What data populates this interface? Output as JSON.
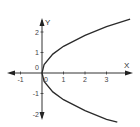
{
  "chart_data": {
    "type": "line",
    "title": "",
    "equation_hint": "sideways parabola x = y^2 / k (opening right, vertex at origin)",
    "xlabel": "X",
    "ylabel": "Y",
    "xlim": [
      -1.5,
      4.2
    ],
    "ylim": [
      -2.2,
      2.6
    ],
    "grid": false,
    "legend": null,
    "x_ticks": [
      "-1",
      "0",
      "1",
      "2",
      "3"
    ],
    "y_ticks": [
      "2",
      "1",
      "0",
      "-1",
      "-2"
    ],
    "series": [
      {
        "name": "curve",
        "points": [
          [
            4.1,
            2.63
          ],
          [
            3.0,
            2.26
          ],
          [
            2.0,
            1.84
          ],
          [
            1.0,
            1.3
          ],
          [
            0.5,
            0.92
          ],
          [
            0.1,
            0.41
          ],
          [
            0.0,
            0.0
          ],
          [
            0.1,
            -0.41
          ],
          [
            0.5,
            -0.92
          ],
          [
            1.0,
            -1.3
          ],
          [
            2.0,
            -1.84
          ],
          [
            3.0,
            -2.26
          ],
          [
            3.5,
            -2.4
          ]
        ]
      }
    ],
    "origin_label": "0"
  },
  "colors": {
    "axis": "#333333",
    "curve": "#2b2b2b",
    "text": "#444444"
  }
}
